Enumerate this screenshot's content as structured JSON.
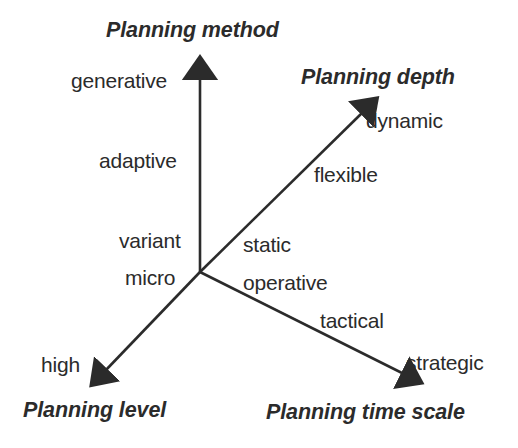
{
  "diagram": {
    "type": "three-axis-classification-diagram",
    "background_color": "#ffffff",
    "line_color": "#2b2b2b",
    "text_color": "#2b2b2b",
    "origin": {
      "x": 200,
      "y": 272
    },
    "axes": [
      {
        "id": "planning-method",
        "title": "Planning method",
        "direction": "up",
        "arrow_tip": {
          "x": 200,
          "y": 63
        },
        "scale_labels": [
          "generative",
          "adaptive",
          "variant",
          "micro"
        ]
      },
      {
        "id": "planning-depth",
        "title": "Planning depth",
        "direction": "upper-right",
        "arrow_tip": {
          "x": 374,
          "y": 100
        },
        "scale_labels": [
          "dynamic",
          "flexible",
          "static"
        ]
      },
      {
        "id": "planning-level",
        "title": "Planning level",
        "direction": "lower-left",
        "arrow_tip": {
          "x": 95,
          "y": 381
        },
        "scale_labels": [
          "high"
        ]
      },
      {
        "id": "planning-time-scale",
        "title": "Planning time scale",
        "direction": "lower-right",
        "arrow_tip": {
          "x": 416,
          "y": 381
        },
        "scale_labels": [
          "operative",
          "tactical",
          "strategic"
        ]
      }
    ],
    "titles": {
      "planning_method": "Planning method",
      "planning_depth": "Planning depth",
      "planning_level": "Planning level",
      "planning_time_scale": "Planning time scale"
    },
    "labels": {
      "generative": "generative",
      "adaptive": "adaptive",
      "variant": "variant",
      "micro": "micro",
      "dynamic": "dynamic",
      "flexible": "flexible",
      "static": "static",
      "operative": "operative",
      "tactical": "tactical",
      "strategic": "strategic",
      "high": "high"
    }
  }
}
